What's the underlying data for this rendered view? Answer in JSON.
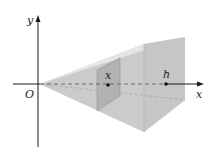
{
  "diagram": {
    "type": "pyramid-cross-section",
    "labels": {
      "y_axis": "y",
      "x_axis": "x",
      "origin": "O",
      "section_point": "x",
      "height_point": "h"
    },
    "colors": {
      "axis": "#1a1a1a",
      "top_face": "#e2e2e2",
      "left_face": "#cbcbcb",
      "bottom_face": "#d6d6d6",
      "base_face": "#c4c4c4",
      "cross_section": "#a8a8a8",
      "dash": "#555555"
    }
  }
}
